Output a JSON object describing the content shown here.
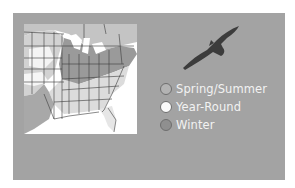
{
  "map": {
    "title": "",
    "region": "Eastern United States",
    "icon": "bird-silhouette-icon"
  },
  "legend": {
    "items": [
      {
        "label": "Spring/Summer",
        "color": "#b3b3b3"
      },
      {
        "label": "Year-Round",
        "color": "#fafafa"
      },
      {
        "label": "Winter",
        "color": "#8f8f8f"
      }
    ]
  },
  "colors": {
    "card_background": "#a3a3a3",
    "map_background": "#ffffff",
    "state_line": "#3a3a3a",
    "bird": "#3c3c3c"
  }
}
